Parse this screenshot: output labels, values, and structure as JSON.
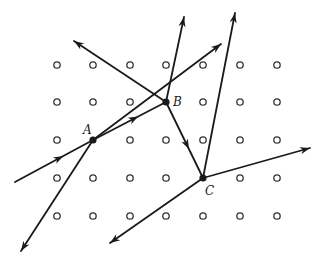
{
  "diagram": {
    "type": "scattering vertices on lattice",
    "colors": {
      "line": "#1a1a1a",
      "dot": "#333333",
      "background": "#ffffff"
    },
    "grid": {
      "columns_x": [
        57,
        93,
        130,
        166,
        203,
        240,
        277
      ],
      "rows_y": [
        65,
        102,
        140,
        178,
        216
      ]
    },
    "vertices": [
      {
        "id": "A",
        "label": "A",
        "x": 93,
        "y": 140,
        "label_x": 83,
        "label_y": 134
      },
      {
        "id": "B",
        "label": "B",
        "x": 166,
        "y": 102,
        "label_x": 173,
        "label_y": 106
      },
      {
        "id": "C",
        "label": "C",
        "x": 203,
        "y": 178,
        "label_x": 205,
        "label_y": 195
      }
    ],
    "lines": [
      {
        "name": "incoming-to-A",
        "x1": 15,
        "y1": 182,
        "x2": 93,
        "y2": 140,
        "mid_arrow": true,
        "end_arrow": false
      },
      {
        "name": "A-to-B",
        "x1": 93,
        "y1": 140,
        "x2": 166,
        "y2": 102,
        "mid_arrow": true,
        "end_arrow": false
      },
      {
        "name": "A-outgoing-upper-right",
        "x1": 93,
        "y1": 140,
        "x2": 221,
        "y2": 44,
        "mid_arrow": false,
        "end_arrow": true
      },
      {
        "name": "A-outgoing-lower-left",
        "x1": 93,
        "y1": 140,
        "x2": 21,
        "y2": 251,
        "mid_arrow": false,
        "end_arrow": true
      },
      {
        "name": "B-outgoing-up",
        "x1": 166,
        "y1": 102,
        "x2": 184,
        "y2": 17,
        "mid_arrow": false,
        "end_arrow": true
      },
      {
        "name": "B-outgoing-upper-left",
        "x1": 166,
        "y1": 102,
        "x2": 74,
        "y2": 41,
        "mid_arrow": false,
        "end_arrow": true
      },
      {
        "name": "B-to-C",
        "x1": 166,
        "y1": 102,
        "x2": 203,
        "y2": 178,
        "mid_arrow": true,
        "end_arrow": false
      },
      {
        "name": "C-outgoing-up",
        "x1": 203,
        "y1": 178,
        "x2": 235,
        "y2": 13,
        "mid_arrow": false,
        "end_arrow": true
      },
      {
        "name": "C-outgoing-right",
        "x1": 203,
        "y1": 178,
        "x2": 310,
        "y2": 148,
        "mid_arrow": false,
        "end_arrow": true
      },
      {
        "name": "C-outgoing-lower-left",
        "x1": 203,
        "y1": 178,
        "x2": 110,
        "y2": 243,
        "mid_arrow": false,
        "end_arrow": true
      }
    ]
  }
}
